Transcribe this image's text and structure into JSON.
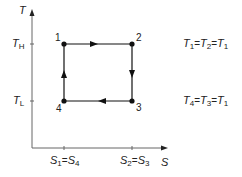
{
  "diagram": {
    "axes": {
      "y_label": "T",
      "x_label": "S",
      "y_ticks": [
        {
          "base": "T",
          "sub": "H"
        },
        {
          "base": "T",
          "sub": "L"
        }
      ],
      "x_ticks": [
        {
          "a_base": "S",
          "a_sub": "1",
          "eq": "=",
          "b_base": "S",
          "b_sub": "4"
        },
        {
          "a_base": "S",
          "a_sub": "2",
          "eq": "=",
          "b_base": "S",
          "b_sub": "3"
        }
      ]
    },
    "points": [
      {
        "label": "1",
        "x": 64,
        "y": 44
      },
      {
        "label": "2",
        "x": 132,
        "y": 44
      },
      {
        "label": "3",
        "x": 132,
        "y": 101
      },
      {
        "label": "4",
        "x": 64,
        "y": 101
      }
    ],
    "edges": [
      {
        "from": "1",
        "to": "2",
        "direction": "right"
      },
      {
        "from": "2",
        "to": "3",
        "direction": "down"
      },
      {
        "from": "3",
        "to": "4",
        "direction": "left"
      },
      {
        "from": "4",
        "to": "1",
        "direction": "up"
      }
    ],
    "equations": [
      {
        "t1": "T",
        "s1": "1",
        "eq1": "=",
        "t2": "T",
        "s2": "2",
        "eq2": "=",
        "t3": "T",
        "s3": "1"
      },
      {
        "t1": "T",
        "s1": "4",
        "eq1": "=",
        "t2": "T",
        "s2": "3",
        "eq2": "=",
        "t3": "T",
        "s3": "1"
      }
    ],
    "colors": {
      "line": "#111111",
      "axis": "#555555",
      "text": "#222222"
    }
  }
}
